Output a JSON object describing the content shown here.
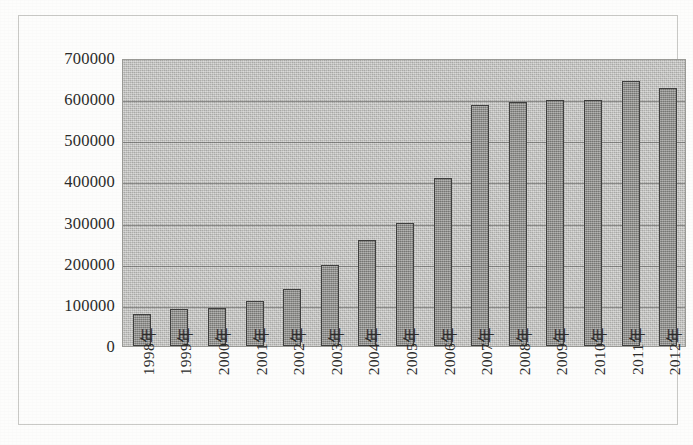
{
  "chart_data": {
    "type": "bar",
    "title": "",
    "subtitle": "",
    "xlabel": "",
    "ylabel": "",
    "grid": true,
    "legend": null,
    "ylim": [
      0,
      700000
    ],
    "ytick_labels": [
      "700000",
      "600000",
      "500000",
      "400000",
      "300000",
      "200000",
      "100000",
      "0"
    ],
    "ytick_values": [
      700000,
      600000,
      500000,
      400000,
      300000,
      200000,
      100000,
      0
    ],
    "categories": [
      "1998年",
      "1999年",
      "2000年",
      "2001年",
      "2002年",
      "2003年",
      "2004年",
      "2005年",
      "2006年",
      "2007年",
      "2008年",
      "2009年",
      "2010年",
      "2011年",
      "2012年"
    ],
    "values": [
      78000,
      90000,
      92000,
      110000,
      138000,
      198000,
      258000,
      299000,
      409000,
      586000,
      592000,
      599000,
      599000,
      645000,
      626000
    ]
  },
  "style": {
    "plot_background": "#b9b9b6",
    "bar_fill": "#8f8f8c",
    "bar_border": "#3f3f3e",
    "gridline_color": "#50504e",
    "frame_color": "#c9c9c6",
    "text_color": "#2b2b2a",
    "page_background": "#fdfdfc"
  }
}
